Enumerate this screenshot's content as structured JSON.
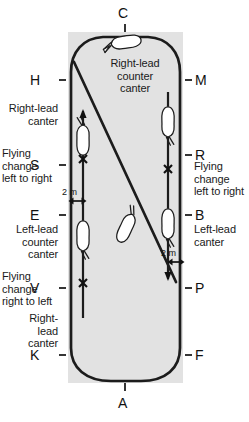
{
  "diagram": {
    "arena": {
      "fill_color": "#e2e2e2",
      "x": 68,
      "y": 32,
      "width": 115,
      "height": 351
    },
    "track": {
      "stroke_color": "#1c1c1c",
      "stroke_width": 2.6
    }
  },
  "markers": {
    "top": {
      "label": "C",
      "side": "top"
    },
    "bottom": {
      "label": "A",
      "side": "bottom"
    },
    "left": [
      {
        "label": "H"
      },
      {
        "label": "S"
      },
      {
        "label": "E"
      },
      {
        "label": "V"
      },
      {
        "label": "K"
      }
    ],
    "right": [
      {
        "label": "M"
      },
      {
        "label": "R"
      },
      {
        "label": "B"
      },
      {
        "label": "P"
      },
      {
        "label": "F"
      }
    ]
  },
  "annotations": {
    "center_top": "Right-lead\ncounter\ncanter",
    "left_upper": "Right-lead\ncanter",
    "left_flying_change_upper": "Flying\nchange\nleft to right",
    "left_mid": "Left-lead\ncounter\ncanter",
    "left_flying_change_lower": "Flying\nchange\nright to left",
    "left_lower": "Right-\nlead\ncanter",
    "right_flying_change": "Flying\nchange\nleft to right",
    "right_mid": "Left-lead\ncanter"
  },
  "dimensions": {
    "left_distance": "2 m",
    "right_distance": "2 m"
  },
  "icons": {
    "flying_change": "x-marker-icon",
    "direction_arrow_up": "arrow-up-icon",
    "direction_arrow_down": "arrow-down-icon",
    "distance_arrow": "double-arrow-icon",
    "horse": "horse-figure-icon"
  }
}
